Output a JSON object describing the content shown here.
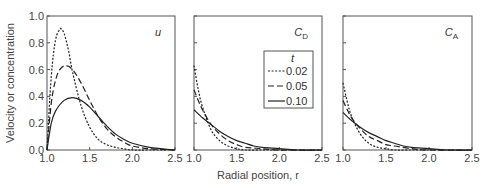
{
  "chart_data": {
    "type": "line",
    "xlabel": "Radial position, r",
    "ylabel": "Velocity or concentration",
    "xlim": [
      1.0,
      2.5
    ],
    "ylim": [
      0.0,
      1.0
    ],
    "xticks": [
      "1.0",
      "1.5",
      "2.0",
      "2.5"
    ],
    "yticks": [
      "0.0",
      "0.2",
      "0.4",
      "0.6",
      "0.8",
      "1.0"
    ],
    "legend": {
      "title": "t",
      "placement": "inside middle panel, top-right",
      "entries": [
        {
          "label": "0.02",
          "style": "dotted"
        },
        {
          "label": "0.05",
          "style": "dashed"
        },
        {
          "label": "0.10",
          "style": "solid"
        }
      ]
    },
    "panels": [
      {
        "label": "u",
        "label_sub": "",
        "series": [
          {
            "name": "0.02",
            "style": "dotted",
            "x": [
              1.0,
              1.05,
              1.1,
              1.15,
              1.17,
              1.2,
              1.25,
              1.3,
              1.4,
              1.5,
              1.6,
              1.7,
              1.8,
              1.9,
              2.0,
              2.2,
              2.5
            ],
            "y": [
              0.0,
              0.55,
              0.82,
              0.9,
              0.9,
              0.87,
              0.75,
              0.58,
              0.33,
              0.17,
              0.08,
              0.04,
              0.02,
              0.01,
              0.0,
              0.0,
              0.0
            ]
          },
          {
            "name": "0.05",
            "style": "dashed",
            "x": [
              1.0,
              1.05,
              1.1,
              1.15,
              1.22,
              1.3,
              1.4,
              1.5,
              1.6,
              1.7,
              1.8,
              1.9,
              2.0,
              2.2,
              2.5
            ],
            "y": [
              0.0,
              0.35,
              0.52,
              0.6,
              0.63,
              0.6,
              0.5,
              0.37,
              0.25,
              0.16,
              0.1,
              0.06,
              0.03,
              0.01,
              0.0
            ]
          },
          {
            "name": "0.10",
            "style": "solid",
            "x": [
              1.0,
              1.05,
              1.1,
              1.2,
              1.3,
              1.4,
              1.5,
              1.6,
              1.7,
              1.8,
              1.9,
              2.0,
              2.2,
              2.5
            ],
            "y": [
              0.0,
              0.2,
              0.29,
              0.37,
              0.39,
              0.37,
              0.32,
              0.25,
              0.18,
              0.12,
              0.08,
              0.05,
              0.02,
              0.0
            ]
          }
        ]
      },
      {
        "label": "C",
        "label_sub": "D",
        "series": [
          {
            "name": "0.02",
            "style": "dotted",
            "x": [
              1.0,
              1.05,
              1.1,
              1.2,
              1.3,
              1.4,
              1.5,
              1.6,
              1.8,
              2.0,
              2.5
            ],
            "y": [
              0.63,
              0.45,
              0.32,
              0.15,
              0.07,
              0.03,
              0.01,
              0.0,
              0.0,
              0.0,
              0.0
            ]
          },
          {
            "name": "0.05",
            "style": "dashed",
            "x": [
              1.0,
              1.05,
              1.1,
              1.2,
              1.3,
              1.4,
              1.5,
              1.6,
              1.8,
              2.0,
              2.5
            ],
            "y": [
              0.45,
              0.37,
              0.3,
              0.19,
              0.12,
              0.07,
              0.04,
              0.02,
              0.01,
              0.0,
              0.0
            ]
          },
          {
            "name": "0.10",
            "style": "solid",
            "x": [
              1.0,
              1.1,
              1.2,
              1.3,
              1.4,
              1.5,
              1.6,
              1.7,
              1.8,
              2.0,
              2.2,
              2.5
            ],
            "y": [
              0.3,
              0.24,
              0.19,
              0.14,
              0.1,
              0.07,
              0.05,
              0.03,
              0.02,
              0.01,
              0.0,
              0.0
            ]
          }
        ]
      },
      {
        "label": "C",
        "label_sub": "A",
        "series": [
          {
            "name": "0.02",
            "style": "dotted",
            "x": [
              1.0,
              1.05,
              1.1,
              1.2,
              1.3,
              1.4,
              1.5,
              1.6,
              1.8,
              2.0,
              2.5
            ],
            "y": [
              0.5,
              0.36,
              0.25,
              0.12,
              0.05,
              0.02,
              0.01,
              0.0,
              0.0,
              0.0,
              0.0
            ]
          },
          {
            "name": "0.05",
            "style": "dashed",
            "x": [
              1.0,
              1.05,
              1.1,
              1.2,
              1.3,
              1.4,
              1.5,
              1.6,
              1.8,
              2.0,
              2.5
            ],
            "y": [
              0.37,
              0.3,
              0.24,
              0.16,
              0.1,
              0.07,
              0.04,
              0.03,
              0.01,
              0.0,
              0.0
            ]
          },
          {
            "name": "0.10",
            "style": "solid",
            "x": [
              1.0,
              1.1,
              1.2,
              1.3,
              1.4,
              1.5,
              1.6,
              1.7,
              1.8,
              2.0,
              2.2,
              2.5
            ],
            "y": [
              0.28,
              0.22,
              0.17,
              0.13,
              0.1,
              0.07,
              0.05,
              0.03,
              0.02,
              0.01,
              0.0,
              0.0
            ]
          }
        ]
      }
    ]
  }
}
